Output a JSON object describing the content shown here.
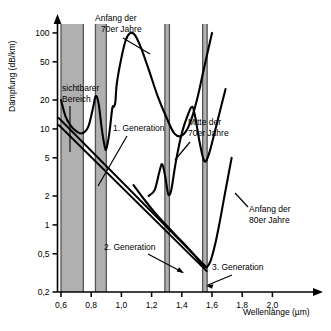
{
  "chart_data": {
    "type": "line",
    "title": "",
    "xlabel": "Wellenlänge (µm)",
    "ylabel": "Dämpfung (dB/km)",
    "yscale": "log",
    "ylim": [
      0.2,
      130
    ],
    "xlim": [
      0.55,
      2.15
    ],
    "grid": false,
    "legend": "none",
    "xticks": [
      "0,6",
      "0,8",
      "1,0",
      "1,2",
      "1,4",
      "1,6",
      "1,8",
      "2,0"
    ],
    "xtick_values": [
      0.6,
      0.8,
      1.0,
      1.2,
      1.4,
      1.6,
      1.8,
      2.0
    ],
    "yticks": [
      "0,2",
      "0,5",
      "1",
      "2",
      "5",
      "10",
      "20",
      "50",
      "100"
    ],
    "ytick_values": [
      0.2,
      0.5,
      1,
      2,
      5,
      10,
      20,
      50,
      100
    ],
    "series": [
      {
        "name": "Anfang der 70er Jahre",
        "points": [
          [
            0.6,
            20.0
          ],
          [
            0.63,
            13.5
          ],
          [
            0.66,
            11.0
          ],
          [
            0.7,
            9.5
          ],
          [
            0.74,
            9.0
          ],
          [
            0.78,
            10.5
          ],
          [
            0.81,
            16.0
          ],
          [
            0.83,
            22.0
          ],
          [
            0.85,
            18.0
          ],
          [
            0.87,
            10.0
          ],
          [
            0.89,
            6.5
          ],
          [
            0.9,
            6.2
          ],
          [
            0.92,
            9.0
          ],
          [
            0.94,
            16.5
          ],
          [
            0.95,
            17.0
          ],
          [
            0.96,
            19.0
          ],
          [
            0.97,
            30.0
          ],
          [
            1.0,
            55.0
          ],
          [
            1.03,
            85.0
          ],
          [
            1.06,
            100.0
          ],
          [
            1.09,
            95.0
          ],
          [
            1.13,
            70.0
          ],
          [
            1.18,
            42.0
          ],
          [
            1.24,
            22.0
          ],
          [
            1.3,
            13.0
          ],
          [
            1.35,
            9.0
          ],
          [
            1.4,
            8.5
          ],
          [
            1.45,
            11.0
          ],
          [
            1.5,
            20.0
          ],
          [
            1.55,
            45.0
          ],
          [
            1.6,
            100.0
          ]
        ]
      },
      {
        "name": "Mitte der 70er Jahre",
        "points": [
          [
            1.18,
            2.0
          ],
          [
            1.22,
            2.3
          ],
          [
            1.25,
            3.5
          ],
          [
            1.27,
            4.3
          ],
          [
            1.29,
            3.2
          ],
          [
            1.31,
            2.1
          ],
          [
            1.33,
            2.3
          ],
          [
            1.36,
            4.5
          ],
          [
            1.4,
            9.0
          ],
          [
            1.44,
            14.0
          ],
          [
            1.47,
            17.0
          ],
          [
            1.49,
            13.0
          ],
          [
            1.52,
            7.0
          ],
          [
            1.55,
            4.6
          ],
          [
            1.58,
            5.5
          ],
          [
            1.62,
            9.5
          ],
          [
            1.66,
            17.0
          ],
          [
            1.69,
            26.0
          ]
        ]
      },
      {
        "name": "Anfang der 80er Jahre",
        "points": [
          [
            1.08,
            2.6
          ],
          [
            1.15,
            1.85
          ],
          [
            1.22,
            1.35
          ],
          [
            1.29,
            1.02
          ],
          [
            1.36,
            0.78
          ],
          [
            1.43,
            0.6
          ],
          [
            1.49,
            0.47
          ],
          [
            1.53,
            0.39
          ],
          [
            1.56,
            0.36
          ],
          [
            1.59,
            0.42
          ],
          [
            1.62,
            0.62
          ],
          [
            1.65,
            1.05
          ],
          [
            1.68,
            1.9
          ],
          [
            1.71,
            3.4
          ],
          [
            1.73,
            5.0
          ]
        ]
      },
      {
        "name": "1. Generation",
        "points": [
          [
            0.585,
            13.0
          ],
          [
            1.565,
            0.36
          ]
        ]
      },
      {
        "name": "2. Generation",
        "points": [
          [
            0.585,
            11.0
          ],
          [
            1.565,
            0.33
          ]
        ]
      }
    ],
    "bands": [
      {
        "name": "sichtbarer-bereich-band",
        "x0": 0.6,
        "x1": 0.748
      },
      {
        "name": "band-0-85",
        "x0": 0.828,
        "x1": 0.9
      },
      {
        "name": "band-1-30",
        "x0": 1.288,
        "x1": 1.318
      },
      {
        "name": "band-1-55",
        "x0": 1.538,
        "x1": 1.568
      }
    ],
    "annotations": [
      {
        "id": "anfang-70er",
        "line1": "Anfang der",
        "line2": "70er Jahre"
      },
      {
        "id": "sichtbarer-bereich",
        "line1": "sichtbarer",
        "line2": "Bereich"
      },
      {
        "id": "mitte-70er",
        "line1": "Mitte  der",
        "line2": "70er Jahre"
      },
      {
        "id": "anfang-80er",
        "line1": "Anfang der",
        "line2": "80er Jahre"
      },
      {
        "id": "generation-1",
        "line1": "1. Generation"
      },
      {
        "id": "generation-2",
        "line1": "2. Generation"
      },
      {
        "id": "generation-3",
        "line1": "3. Generation"
      }
    ],
    "colors": {
      "curve": "#000000",
      "band_fill": "#b0b0b0",
      "band_edge": "#555555",
      "axis": "#000000",
      "background": "#ffffff"
    }
  }
}
